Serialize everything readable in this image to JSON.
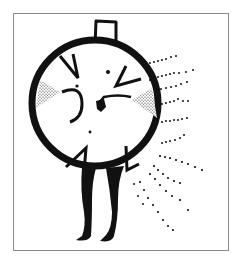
{
  "illustration": {
    "subject": "hand-drawn round clock-like figure with legs, radiating dotted lines",
    "ink_color": "#111111",
    "frame_color": "#8a8a8a",
    "background": "#ffffff"
  }
}
